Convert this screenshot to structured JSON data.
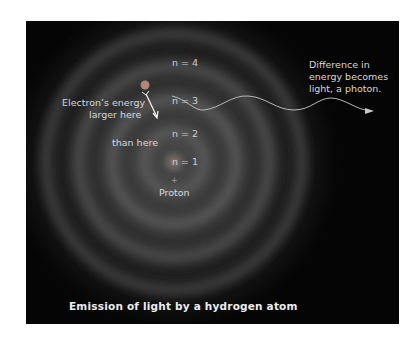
{
  "diagram": {
    "levels": [
      {
        "label": "n = 4"
      },
      {
        "label": "n = 3"
      },
      {
        "label": "n = 2"
      },
      {
        "label": "n = 1"
      }
    ],
    "nucleus": {
      "symbol": "+",
      "label": "Proton"
    },
    "electron_annotation": {
      "line1": "Electron’s energy",
      "line2": "larger here",
      "line3": "than here"
    },
    "photon_annotation": {
      "line1": "Difference in",
      "line2": "energy becomes",
      "line3": "light, a photon."
    },
    "caption": "Emission of light by a hydrogen atom",
    "colors": {
      "background": "#050505",
      "text": "#d8d8d8",
      "electron": "#b0867a"
    }
  }
}
